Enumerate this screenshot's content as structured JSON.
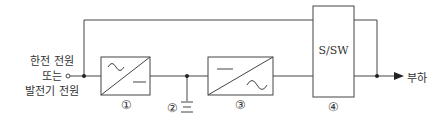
{
  "diagram": {
    "source_label": [
      "한전 전원",
      "또는",
      "발전기 전원"
    ],
    "blocks": [
      {
        "id": "1",
        "number": "①",
        "type": "rectifier",
        "top_symbol": "~",
        "bottom_symbol": "—"
      },
      {
        "id": "2",
        "number": "②",
        "type": "battery"
      },
      {
        "id": "3",
        "number": "③",
        "type": "inverter",
        "top_symbol": "—",
        "bottom_symbol": "~"
      },
      {
        "id": "4",
        "number": "④",
        "type": "static-switch",
        "label": "S/SW"
      }
    ],
    "load_label": "부하",
    "colors": {
      "line": "#444444",
      "background": "#ffffff"
    }
  }
}
